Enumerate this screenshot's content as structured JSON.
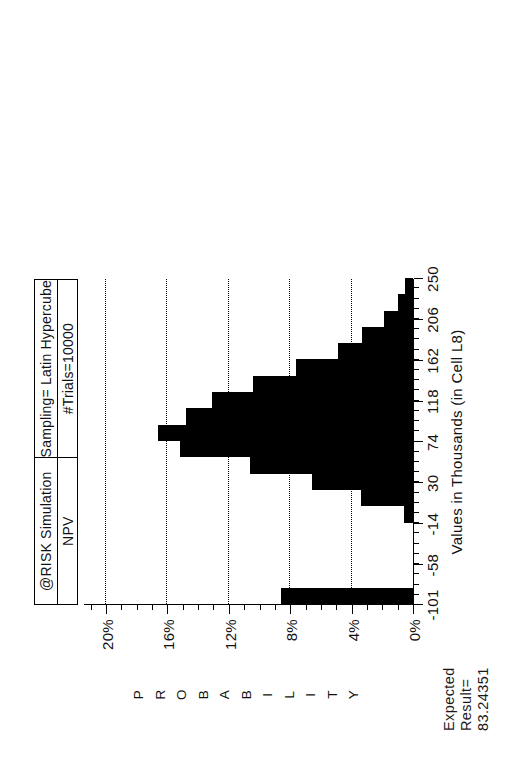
{
  "report": {
    "expected_label": "Expected\nResult=",
    "expected_value": "83.24351",
    "expected_caption": "Expected\nResult=\n83.24351"
  },
  "titlebox": {
    "left_top": "@RISK Simulation",
    "left_bottom": "NPV",
    "right_top": "Sampling= Latin Hypercube",
    "right_bottom": "#Trials=10000"
  },
  "chart_data": {
    "type": "bar",
    "title": "@RISK Simulation  NPV",
    "subtitle": "Sampling= Latin Hypercube   #Trials=10000",
    "xlabel": "Values in Thousands (in Cell L8)",
    "ylabel": "PROBABILITY",
    "xlim": [
      -101,
      250
    ],
    "ylim": [
      0,
      21.5
    ],
    "xtick_labels": [
      "-101",
      "-58",
      "-14",
      "30",
      "74",
      "118",
      "162",
      "206",
      "250"
    ],
    "xtick_values": [
      -101,
      -58,
      -14,
      30,
      74,
      118,
      162,
      206,
      250
    ],
    "xtick_minor_step": 11,
    "ytick_labels": [
      "0%",
      "4%",
      "8%",
      "12%",
      "16%",
      "20%"
    ],
    "ytick_values": [
      0,
      4,
      8,
      12,
      16,
      20
    ],
    "ytick_minor_step": 1,
    "grid": "horizontal-dotted-at-major-y",
    "legend": "none",
    "bin_width": 17.55,
    "bin_centers": [
      -92.2,
      -74.7,
      -57.1,
      -39.6,
      -22.0,
      -4.5,
      13.1,
      30.6,
      48.2,
      65.7,
      83.3,
      100.8,
      118.4,
      135.9,
      153.5,
      171.0,
      188.6,
      206.1,
      223.7,
      241.2
    ],
    "values": [
      8.6,
      0.0,
      0.0,
      0.0,
      0.0,
      0.6,
      3.4,
      6.6,
      10.6,
      15.2,
      16.6,
      14.8,
      13.1,
      10.4,
      7.6,
      4.9,
      3.3,
      1.9,
      1.0,
      0.5
    ],
    "units": "percent"
  },
  "icons": {
    "chart_kind": "histogram-icon"
  }
}
